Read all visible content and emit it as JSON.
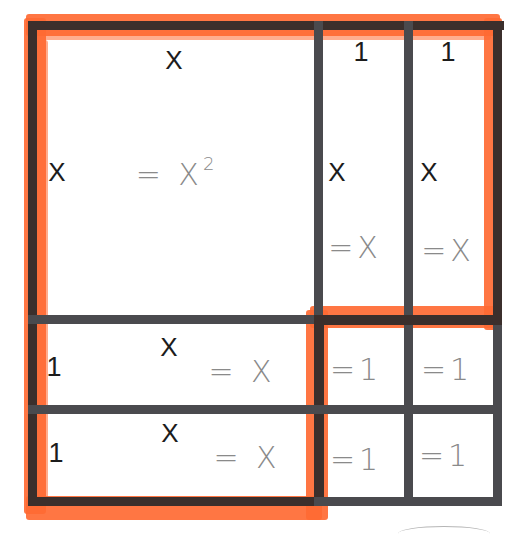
{
  "diagram": {
    "title": "",
    "colors": {
      "highlight": "#ff6a33",
      "grid_line": "#4a4a4e",
      "label": "#1c1c1c",
      "area_text": "#8a8a8a",
      "background": "#ffffff"
    },
    "regions": {
      "big_square": {
        "top_label": "X",
        "side_label": "X",
        "area": "= X",
        "area_exp": "2"
      },
      "right_col_1": {
        "top_label": "1",
        "side_label": "X",
        "area": "=X"
      },
      "right_col_2": {
        "top_label": "1",
        "side_label": "X",
        "area": "=X"
      },
      "bottom_row_1": {
        "side_label": "1",
        "top_label": "X",
        "area": "= X"
      },
      "bottom_row_2": {
        "side_label": "1",
        "top_label": "X",
        "area": "= X"
      },
      "unit_1": {
        "area": "=1"
      },
      "unit_2": {
        "area": "=1"
      },
      "unit_3": {
        "area": "=1"
      },
      "unit_4": {
        "area": "=1"
      }
    },
    "highlighted_groups": [
      "top-row (x^2 + 2x)",
      "left-column (x^2 + 2x)"
    ]
  }
}
